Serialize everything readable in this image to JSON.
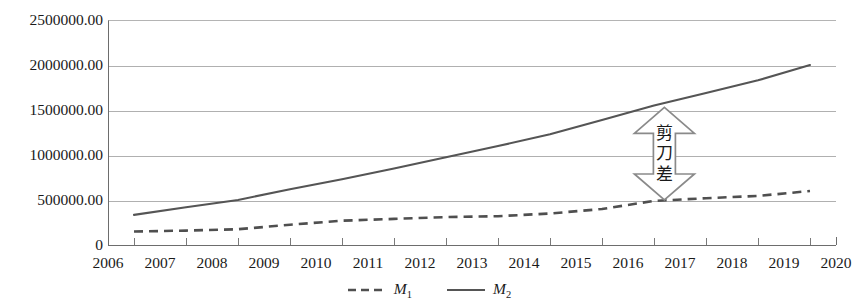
{
  "chart_data": {
    "type": "line",
    "title": "",
    "xlabel": "",
    "ylabel": "",
    "x": [
      2006,
      2007,
      2008,
      2009,
      2010,
      2011,
      2012,
      2013,
      2014,
      2015,
      2016,
      2017,
      2018,
      2019,
      2020
    ],
    "xtick_labels": [
      "2006",
      "2007",
      "2008",
      "2009",
      "2010",
      "2011",
      "2012",
      "2013",
      "2014",
      "2015",
      "2016",
      "2017",
      "2018",
      "2019",
      "2020"
    ],
    "ytick_labels": [
      "0",
      "500000.00",
      "1000000.00",
      "1500000.00",
      "2000000.00",
      "2500000.00"
    ],
    "ytick_values": [
      0,
      500000,
      1000000,
      1500000,
      2000000,
      2500000
    ],
    "xlim": [
      2006,
      2020
    ],
    "ylim": [
      0,
      2500000
    ],
    "grid": "horizontal",
    "legend_position": "bottom-center",
    "series": [
      {
        "name": "M₁",
        "label_base": "M",
        "label_sub": "1",
        "style": "dashed",
        "color": "#4f4f4f",
        "x": [
          2006.5,
          2007.5,
          2008.5,
          2009.5,
          2010.5,
          2011.5,
          2012.5,
          2013.5,
          2014.5,
          2015.5,
          2016.5,
          2017.5,
          2018.5,
          2019.5
        ],
        "values": [
          150000,
          160000,
          175000,
          225000,
          270000,
          290000,
          310000,
          320000,
          350000,
          400000,
          490000,
          520000,
          545000,
          600000
        ]
      },
      {
        "name": "M₂",
        "label_base": "M",
        "label_sub": "2",
        "style": "solid",
        "color": "#555555",
        "x": [
          2006.5,
          2007.5,
          2008.5,
          2009.5,
          2010.5,
          2011.5,
          2012.5,
          2013.5,
          2014.5,
          2015.5,
          2016.5,
          2017.5,
          2018.5,
          2019.5
        ],
        "values": [
          335000,
          420000,
          500000,
          620000,
          730000,
          850000,
          975000,
          1100000,
          1230000,
          1390000,
          1550000,
          1690000,
          1830000,
          2000000
        ]
      }
    ],
    "annotations": [
      {
        "name": "scissors-gap-arrow",
        "text": "剪刀差",
        "text_chars": [
          "剪",
          "刀",
          "差"
        ],
        "type": "double-headed-vertical-arrow",
        "x_position": 2016.7,
        "y_top": 1530000,
        "y_bottom": 500000,
        "color": "#8a8a8a"
      }
    ],
    "colors": {
      "gridline": "#b0b0b0",
      "axis": "#6d6d6d",
      "m1": "#4f4f4f",
      "m2": "#555555",
      "annotation": "#8a8a8a",
      "text": "#1a1a1a",
      "background": "#ffffff"
    }
  }
}
